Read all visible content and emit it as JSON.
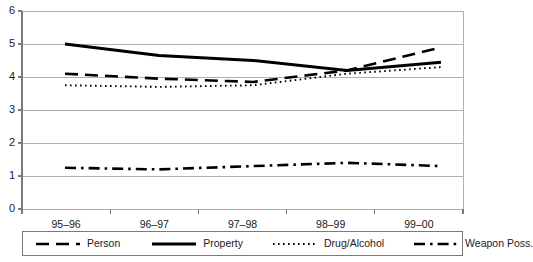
{
  "chart_data": {
    "type": "line",
    "title": "",
    "subtitle": "",
    "xlabel": "",
    "ylabel": "",
    "categories": [
      "95–96",
      "96–97",
      "97–98",
      "98–99",
      "99–00"
    ],
    "ylim": [
      0,
      6
    ],
    "yticks": [
      0,
      1,
      2,
      3,
      4,
      5,
      6
    ],
    "ytick_labels": [
      "0",
      "1",
      "2",
      "3",
      "4",
      "5",
      "6"
    ],
    "grid": true,
    "grid_axis": "y",
    "legend_position": "bottom",
    "series": [
      {
        "name": "Person",
        "values": [
          4.1,
          3.95,
          3.85,
          4.2,
          4.9
        ],
        "style": "long-dash",
        "color": "#000000",
        "width": 2.6
      },
      {
        "name": "Property",
        "values": [
          5.0,
          4.65,
          4.5,
          4.2,
          4.45
        ],
        "style": "solid",
        "color": "#000000",
        "width": 3.0
      },
      {
        "name": "Drug/Alcohol",
        "values": [
          3.75,
          3.7,
          3.75,
          4.1,
          4.3
        ],
        "style": "dotted",
        "color": "#000000",
        "width": 1.9
      },
      {
        "name": "Weapon Poss.",
        "values": [
          1.25,
          1.2,
          1.3,
          1.4,
          1.3
        ],
        "style": "dash-dot",
        "color": "#000000",
        "width": 2.6
      }
    ]
  },
  "axes": {
    "y_tick_labels": [
      "6",
      "5",
      "4",
      "3",
      "2",
      "1",
      "0"
    ],
    "x_tick_labels": [
      "95–96",
      "96–97",
      "97–98",
      "98–99",
      "99–00"
    ]
  },
  "legend": {
    "items": [
      {
        "label": "Person"
      },
      {
        "label": "Property"
      },
      {
        "label": "Drug/Alcohol"
      },
      {
        "label": "Weapon Poss."
      }
    ]
  },
  "colors": {
    "line": "#000000",
    "grid": "#b0b0b0",
    "axis": "#7a7a7a",
    "background": "#ffffff"
  }
}
